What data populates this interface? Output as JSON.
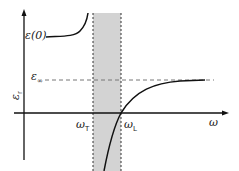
{
  "diagram": {
    "title": "",
    "y_axis_label": "ε",
    "y_axis_subscript": "r",
    "x_axis_label": "ω",
    "eps0_label": "ε(0)",
    "eps_inf_label": "ε",
    "eps_inf_subscript": "∞",
    "omega_T_label": "ω",
    "omega_T_subscript": "T",
    "omega_L_label": "ω",
    "omega_L_subscript": "L",
    "band_color": "#d3d3d3",
    "curve_color": "#111111",
    "dashed_color": "#777777",
    "shaded_region": "reststrahlen band between ωT and ωL"
  }
}
